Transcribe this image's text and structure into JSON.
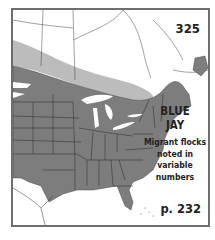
{
  "map": {
    "number": "325",
    "species_line1": "BLUE",
    "species_line2": "JAY",
    "note_lines": [
      "Migrant flocks",
      "noted in",
      "variable",
      "numbers"
    ],
    "page_ref": "p. 232",
    "legend_colors": {
      "year_round_range": "#7d7d7d",
      "winter_migrant_range": "#b9b9b9",
      "land": "#ffffff",
      "water_background": "#ffffff",
      "border": "#6e6e6e"
    }
  }
}
